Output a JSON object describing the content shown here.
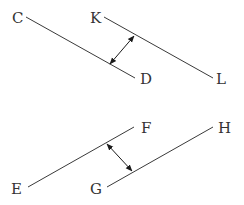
{
  "diagram": {
    "colors": {
      "line": "#3a3a3a",
      "arrow": "#1a1a1a",
      "label": "#333333",
      "background": "#ffffff"
    },
    "pairs": [
      {
        "name": "top-pair",
        "segments": [
          {
            "id": "CD",
            "start_label": "C",
            "end_label": "D",
            "x1": 26,
            "y1": 17,
            "x2": 135,
            "y2": 78
          },
          {
            "id": "KL",
            "start_label": "K",
            "end_label": "L",
            "x1": 104,
            "y1": 17,
            "x2": 213,
            "y2": 78
          }
        ],
        "distance_arrow": {
          "x1": 110,
          "y1": 64,
          "x2": 134,
          "y2": 36
        }
      },
      {
        "name": "bottom-pair",
        "segments": [
          {
            "id": "EF",
            "start_label": "E",
            "end_label": "F",
            "x1": 28,
            "y1": 187,
            "x2": 134,
            "y2": 127
          },
          {
            "id": "GH",
            "start_label": "G",
            "end_label": "H",
            "x1": 107,
            "y1": 187,
            "x2": 213,
            "y2": 127
          }
        ],
        "distance_arrow": {
          "x1": 107,
          "y1": 144,
          "x2": 132,
          "y2": 171
        }
      }
    ],
    "labels": [
      {
        "text": "C",
        "x": 12,
        "y": 23
      },
      {
        "text": "K",
        "x": 90,
        "y": 23
      },
      {
        "text": "D",
        "x": 140,
        "y": 84
      },
      {
        "text": "L",
        "x": 216,
        "y": 84
      },
      {
        "text": "F",
        "x": 141,
        "y": 133
      },
      {
        "text": "H",
        "x": 218,
        "y": 133
      },
      {
        "text": "E",
        "x": 11,
        "y": 194
      },
      {
        "text": "G",
        "x": 90,
        "y": 194
      }
    ]
  }
}
